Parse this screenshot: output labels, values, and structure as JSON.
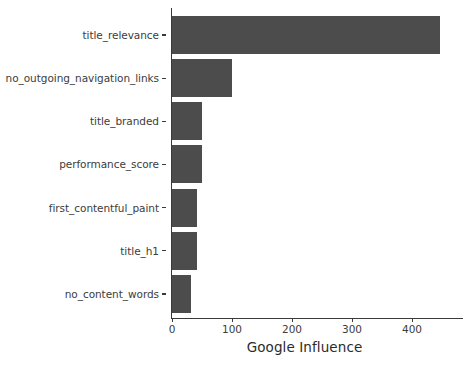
{
  "chart_data": {
    "type": "bar",
    "orientation": "horizontal",
    "title": "",
    "xlabel": "Google Influence",
    "ylabel": "",
    "categories": [
      "title_relevance",
      "no_outgoing_navigation_links",
      "title_branded",
      "performance_score",
      "first_contentful_paint",
      "title_h1",
      "no_content_words"
    ],
    "values": [
      447,
      100,
      50,
      50,
      42,
      42,
      32
    ],
    "xlim": [
      0,
      485
    ],
    "xticks": [
      0,
      100,
      200,
      300,
      400
    ],
    "xticklabels": [
      "0",
      "100",
      "200",
      "300",
      "400"
    ],
    "grid": false,
    "legend": false,
    "bar_color": "#4c4c4c",
    "axis_color": "#3a3a3a",
    "background": "#ffffff"
  }
}
